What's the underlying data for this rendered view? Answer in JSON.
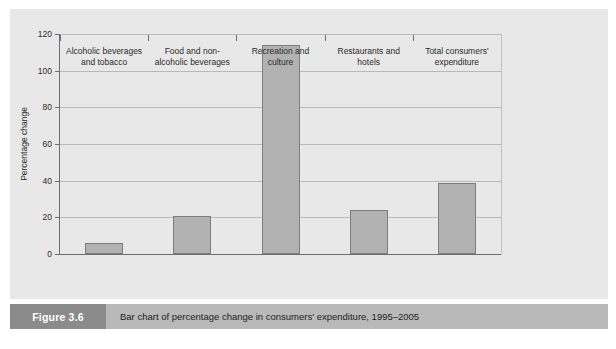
{
  "figure": {
    "number_label": "Figure 3.6",
    "caption": "Bar chart of percentage change in consumers' expenditure, 1995–2005"
  },
  "colors": {
    "panel_background": "#e8e8e8",
    "bar_fill": "#b2b2b2",
    "bar_border": "#7d7d7d",
    "axis_line": "#6e6e6e",
    "gridline": "#b9b9b9",
    "caption_bar": "#b9b9b9",
    "caption_number_box": "#8b8b8b",
    "caption_number_text": "#ffffff",
    "text": "#2b2b2b"
  },
  "chart_data": {
    "type": "bar",
    "title": "",
    "subtitle": "",
    "xlabel": "",
    "ylabel": "Percentage change",
    "categories": [
      "Alcoholic beverages and tobacco",
      "Food and non-alcoholic beverages",
      "Recreation and culture",
      "Restaurants and hotels",
      "Total consumers' expenditure"
    ],
    "category_lines": [
      [
        "Alcoholic beverages",
        "and tobacco"
      ],
      [
        "Food and non-",
        "alcoholic beverages"
      ],
      [
        "Recreation and",
        "culture"
      ],
      [
        "Restaurants and",
        "hotels"
      ],
      [
        "Total consumers'",
        "expenditure"
      ]
    ],
    "values": [
      6,
      21,
      114,
      24,
      39
    ],
    "ylim": [
      0,
      120
    ],
    "yticks": [
      0,
      20,
      40,
      60,
      80,
      100,
      120
    ],
    "ytick_labels": [
      "0",
      "20",
      "40",
      "60",
      "80",
      "100",
      "120"
    ],
    "grid": true,
    "legend": false,
    "legend_position": "none"
  }
}
